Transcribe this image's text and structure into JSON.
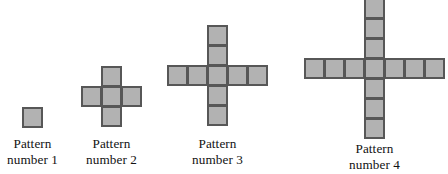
{
  "figure": {
    "background_color": "#ffffff",
    "cell_fill_color": "#b2b2b2",
    "cell_border_color": "#575757",
    "cell_size_px": 21,
    "patterns": [
      {
        "id": "pattern-1",
        "number": 1,
        "arm_length": 0,
        "square_count": 1,
        "label_line_1": "Pattern",
        "label_line_2": "number 1",
        "cells": [
          [
            0,
            0
          ]
        ],
        "center_x": 32,
        "center_y": 117,
        "label_x": 0,
        "label_y": 136,
        "label_width": 65
      },
      {
        "id": "pattern-2",
        "number": 2,
        "arm_length": 1,
        "square_count": 5,
        "label_line_1": "Pattern",
        "label_line_2": "number 2",
        "cells": [
          [
            0,
            0
          ],
          [
            -1,
            0
          ],
          [
            1,
            0
          ],
          [
            0,
            -1
          ],
          [
            0,
            1
          ]
        ],
        "center_x": 111,
        "center_y": 96,
        "label_x": 79,
        "label_y": 136,
        "label_width": 65
      },
      {
        "id": "pattern-3",
        "number": 3,
        "arm_length": 2,
        "square_count": 9,
        "label_line_1": "Pattern",
        "label_line_2": "number 3",
        "cells": [
          [
            0,
            0
          ],
          [
            -1,
            0
          ],
          [
            -2,
            0
          ],
          [
            1,
            0
          ],
          [
            2,
            0
          ],
          [
            0,
            -1
          ],
          [
            0,
            -2
          ],
          [
            0,
            1
          ],
          [
            0,
            2
          ]
        ],
        "center_x": 217,
        "center_y": 75,
        "label_x": 185,
        "label_y": 136,
        "label_width": 65
      },
      {
        "id": "pattern-4",
        "number": 4,
        "arm_length": 3,
        "square_count": 13,
        "label_line_1": "Pattern",
        "label_line_2": "number 4",
        "cells": [
          [
            0,
            0
          ],
          [
            -1,
            0
          ],
          [
            -2,
            0
          ],
          [
            -3,
            0
          ],
          [
            1,
            0
          ],
          [
            2,
            0
          ],
          [
            3,
            0
          ],
          [
            0,
            -1
          ],
          [
            0,
            -2
          ],
          [
            0,
            -3
          ],
          [
            0,
            1
          ],
          [
            0,
            2
          ],
          [
            0,
            3
          ]
        ],
        "center_x": 374,
        "center_y": 68,
        "label_x": 342,
        "label_y": 141,
        "label_width": 65
      }
    ]
  }
}
